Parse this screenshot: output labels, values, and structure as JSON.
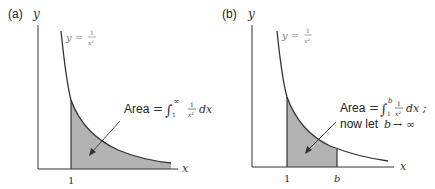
{
  "panels": [
    {
      "id": "a",
      "label": "(a)",
      "y_axis_label": "y",
      "x_axis_label": "x",
      "curve_label": {
        "lhs": "y =",
        "num": "1",
        "den": "x²"
      },
      "tick_1": "1",
      "annotation": {
        "word": "Area",
        "eq": "=",
        "integral": "∫",
        "upper": "∞",
        "lower": "1",
        "num": "1",
        "den": "x²",
        "dx": "dx"
      }
    },
    {
      "id": "b",
      "label": "(b)",
      "y_axis_label": "y",
      "x_axis_label": "x",
      "curve_label": {
        "lhs": "y =",
        "num": "1",
        "den": "x²"
      },
      "tick_1": "1",
      "tick_b": "b",
      "annotation": {
        "word": "Area",
        "eq": "=",
        "integral": "∫",
        "upper": "b",
        "lower": "1",
        "num": "1",
        "den": "x²",
        "dx": "dx ;",
        "line2_prefix": "now let",
        "line2_var": "b",
        "line2_arrow": "→",
        "line2_inf": "∞"
      }
    }
  ],
  "colors": {
    "axis": "#333333",
    "curve": "#333333",
    "shade": "#b3b3b3"
  }
}
